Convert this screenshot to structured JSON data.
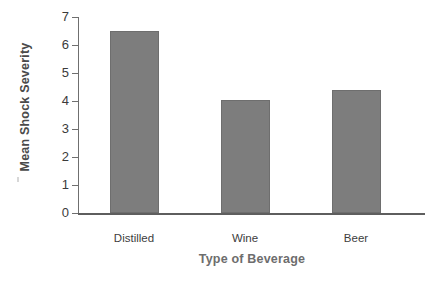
{
  "chart_data": {
    "type": "bar",
    "title": "",
    "subtitle": "",
    "xlabel": "Type of Beverage",
    "ylabel": "Mean Shock Severity",
    "categories": [
      "Distilled",
      "Wine",
      "Beer"
    ],
    "values": [
      6.5,
      4.05,
      4.4
    ],
    "series": [
      {
        "name": "Mean Shock Severity",
        "values": [
          6.5,
          4.05,
          4.4
        ]
      }
    ],
    "ylim": [
      0,
      7
    ],
    "ytick_labels": [
      "0",
      "1",
      "2",
      "3",
      "4",
      "5",
      "6",
      "7"
    ],
    "ytick_values": [
      0,
      1,
      2,
      3,
      4,
      5,
      6,
      7
    ],
    "grid": false,
    "legend": false,
    "legend_position": "none",
    "bar_color": "#7d7d7d",
    "axis_color": "#6f6f6f",
    "text_color": "#3b3b3b"
  },
  "axes": {
    "y_title": "Mean Shock Severity",
    "x_title": "Type of Beverage"
  }
}
